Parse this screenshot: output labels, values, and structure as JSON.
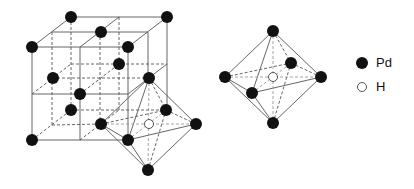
{
  "figure": {
    "colors": {
      "pd": "#111111",
      "h_fill": "#ffffff",
      "h_stroke": "#555555",
      "line": "#555555"
    }
  },
  "legend": {
    "items": [
      {
        "symbol": "filled-circle",
        "label": "Pd"
      },
      {
        "symbol": "open-circle",
        "label": "H"
      }
    ]
  }
}
